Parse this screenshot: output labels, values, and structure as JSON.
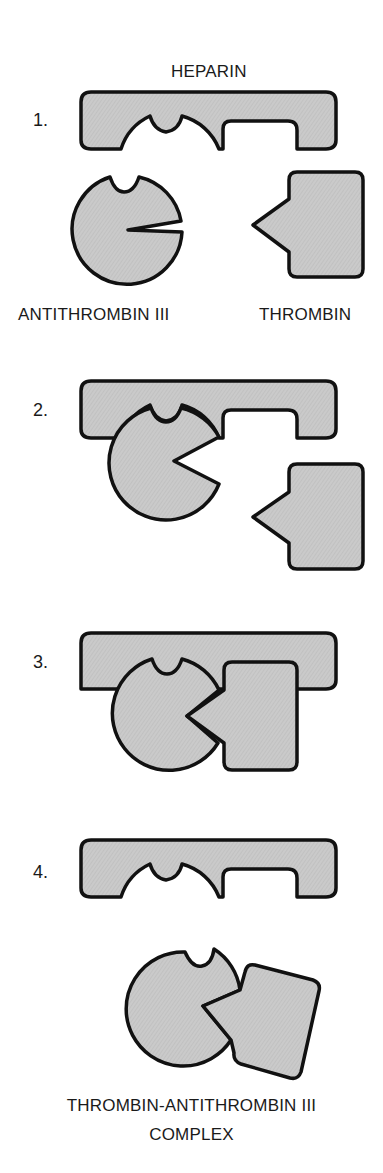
{
  "diagram": {
    "type": "mechanism-sequence",
    "title_label": "HEPARIN",
    "colors": {
      "fill": "#c9c9c9",
      "stroke": "#111111",
      "background": "#ffffff"
    },
    "steps": [
      {
        "number": "1.",
        "labels": [
          "ANTITHROMBIN III",
          "THROMBIN"
        ],
        "description": "Heparin, antithrombin III and thrombin separate"
      },
      {
        "number": "2.",
        "labels": [],
        "description": "Antithrombin III binds heparin; active site opens"
      },
      {
        "number": "3.",
        "labels": [],
        "description": "Thrombin binds antithrombin III on heparin"
      },
      {
        "number": "4.",
        "labels": [],
        "description": "Complex releases from heparin"
      }
    ],
    "final_label_line1": "THROMBIN-ANTITHROMBIN III",
    "final_label_line2": "COMPLEX",
    "nodes": [
      "HEPARIN",
      "ANTITHROMBIN III",
      "THROMBIN",
      "THROMBIN-ANTITHROMBIN III COMPLEX"
    ]
  }
}
